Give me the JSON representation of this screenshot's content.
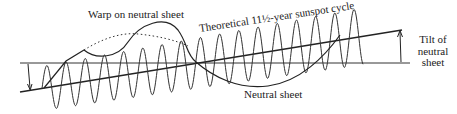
{
  "diagram": {
    "labels": {
      "warp": "Warp on neutral sheet",
      "cycle": "Theoretical 11½-year sunspot cycle",
      "neutral_sheet": "Neutral sheet",
      "tilt_line1": "Tilt of",
      "tilt_line2": "neutral",
      "tilt_line3": "sheet"
    },
    "colors": {
      "ink": "#222222",
      "background": "#ffffff"
    }
  }
}
